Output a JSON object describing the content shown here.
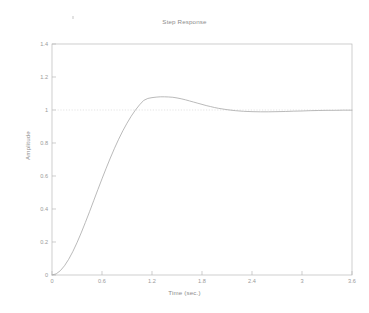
{
  "figure": {
    "title": "Step Response",
    "background": "#ffffff"
  },
  "axes": {
    "x_label": "Time (sec.)",
    "y_label": "Amplitude",
    "x_ticks": [
      "0",
      "0.6",
      "1.2",
      "1.8",
      "2.4",
      "3",
      "3.6"
    ],
    "y_ticks": [
      "0",
      "0.2",
      "0.4",
      "0.6",
      "0.8",
      "1",
      "1.2",
      "1.4"
    ],
    "axis_color": "#b9b9b9"
  },
  "colors": {
    "curve": "#a8a8a8",
    "reference_line": "#d8d8d8",
    "axis": "#b9b9b9",
    "text": "#8c8c8c",
    "tick_text": "#9a9a9a"
  },
  "chart_data": {
    "type": "line",
    "title": "Step Response",
    "xlabel": "Time (sec.)",
    "ylabel": "Amplitude",
    "xlim": [
      0,
      3.6
    ],
    "ylim": [
      0,
      1.4
    ],
    "xticks": [
      0,
      0.6,
      1.2,
      1.8,
      2.4,
      3,
      3.6
    ],
    "yticks": [
      0,
      0.2,
      0.4,
      0.6,
      0.8,
      1,
      1.2,
      1.4
    ],
    "grid": false,
    "legend": null,
    "annotations": [
      {
        "type": "hline",
        "y": 1,
        "style": "dotted",
        "label": "steady-state reference"
      }
    ],
    "series": [
      {
        "name": "Step Response",
        "x": [
          0,
          0.05,
          0.1,
          0.15,
          0.2,
          0.25,
          0.3,
          0.35,
          0.4,
          0.45,
          0.5,
          0.55,
          0.6,
          0.65,
          0.7,
          0.75,
          0.8,
          0.85,
          0.9,
          0.95,
          1.0,
          1.05,
          1.1,
          1.15,
          1.2,
          1.25,
          1.3,
          1.35,
          1.4,
          1.45,
          1.5,
          1.55,
          1.6,
          1.65,
          1.7,
          1.75,
          1.8,
          1.85,
          1.9,
          1.95,
          2.0,
          2.1,
          2.2,
          2.3,
          2.4,
          2.5,
          2.6,
          2.7,
          2.8,
          2.9,
          3.0,
          3.1,
          3.2,
          3.3,
          3.4,
          3.5,
          3.6
        ],
        "y": [
          0.0,
          0.007,
          0.026,
          0.056,
          0.095,
          0.142,
          0.196,
          0.255,
          0.318,
          0.383,
          0.45,
          0.517,
          0.583,
          0.647,
          0.709,
          0.768,
          0.823,
          0.874,
          0.92,
          0.962,
          0.999,
          1.031,
          1.058,
          1.07,
          1.075,
          1.078,
          1.08,
          1.08,
          1.079,
          1.077,
          1.073,
          1.068,
          1.062,
          1.055,
          1.048,
          1.041,
          1.034,
          1.027,
          1.021,
          1.015,
          1.01,
          1.002,
          0.996,
          0.992,
          0.99,
          0.989,
          0.989,
          0.99,
          0.991,
          0.993,
          0.994,
          0.996,
          0.997,
          0.998,
          0.998,
          0.999,
          0.999
        ]
      }
    ],
    "system": {
      "peak_amplitude": 1.08,
      "peak_time": 1.44,
      "steady_state": 1.0,
      "overshoot_percent": 8
    }
  }
}
